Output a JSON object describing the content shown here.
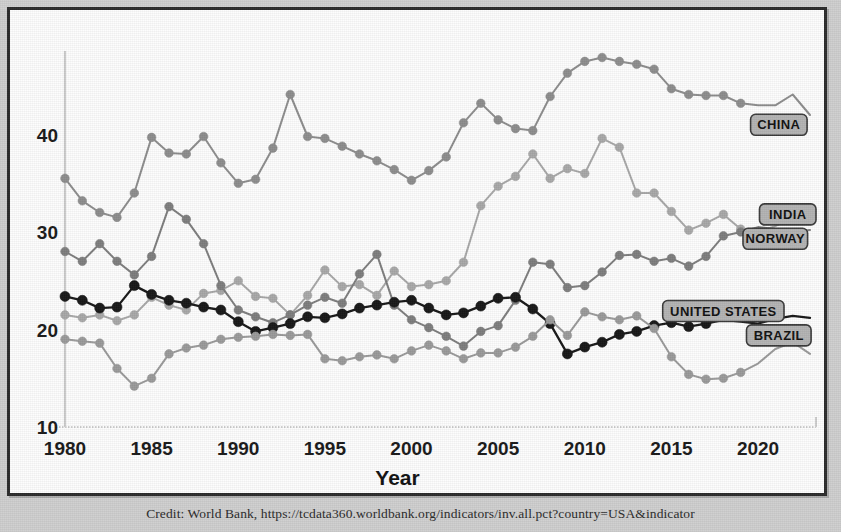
{
  "figure": {
    "credit": "Credit: World Bank, https://tcdata360.worldbank.org/indicators/inv.all.pct?country=USA&indicator"
  },
  "chart_data": {
    "type": "line",
    "title": "",
    "xlabel": "Year",
    "ylabel": "",
    "xlim": [
      1980,
      2023
    ],
    "ylim": [
      10,
      50
    ],
    "grid": false,
    "legend_position": "right-inline-labels",
    "xticks": [
      1980,
      1985,
      1990,
      1995,
      2000,
      2005,
      2010,
      2015,
      2020
    ],
    "yticks": [
      10,
      20,
      30,
      40
    ],
    "x": [
      1980,
      1981,
      1982,
      1983,
      1984,
      1985,
      1986,
      1987,
      1988,
      1989,
      1990,
      1991,
      1992,
      1993,
      1994,
      1995,
      1996,
      1997,
      1998,
      1999,
      2000,
      2001,
      2002,
      2003,
      2004,
      2005,
      2006,
      2007,
      2008,
      2009,
      2010,
      2011,
      2012,
      2013,
      2014,
      2015,
      2016,
      2017,
      2018,
      2019,
      2020,
      2021,
      2022,
      2023
    ],
    "series": [
      {
        "name": "CHINA",
        "color": "#8d8d8d",
        "marker": "circle",
        "values": [
          35.5,
          33.2,
          32.0,
          31.5,
          34.0,
          39.7,
          38.1,
          38.0,
          39.8,
          37.1,
          35.0,
          35.4,
          38.6,
          44.1,
          39.8,
          39.6,
          38.8,
          38.0,
          37.3,
          36.4,
          35.3,
          36.3,
          37.7,
          41.2,
          43.2,
          41.5,
          40.6,
          40.4,
          43.9,
          46.3,
          47.5,
          47.9,
          47.5,
          47.2,
          46.7,
          44.7,
          44.1,
          44.0,
          44.0,
          43.2,
          43.0,
          43.0,
          44.1,
          42.0
        ]
      },
      {
        "name": "INDIA",
        "color": "#a8a8a8",
        "marker": "circle",
        "values": [
          21.5,
          21.2,
          21.5,
          20.9,
          21.5,
          23.3,
          22.5,
          22.0,
          23.7,
          24.0,
          25.0,
          23.4,
          23.2,
          21.5,
          23.5,
          26.1,
          24.4,
          24.6,
          23.5,
          26.0,
          24.4,
          24.6,
          25.0,
          26.9,
          32.7,
          34.7,
          35.7,
          38.0,
          35.5,
          36.5,
          36.0,
          39.6,
          38.7,
          34.0,
          34.0,
          32.1,
          30.2,
          30.9,
          31.8,
          30.3,
          30.0,
          30.6,
          31.5,
          31.4
        ]
      },
      {
        "name": "NORWAY",
        "color": "#7e7e7e",
        "marker": "circle",
        "values": [
          28.0,
          27.0,
          28.8,
          27.0,
          25.6,
          27.5,
          32.6,
          31.3,
          28.8,
          24.5,
          22.0,
          21.3,
          20.7,
          21.5,
          22.5,
          23.3,
          22.7,
          25.7,
          27.7,
          22.5,
          21.0,
          20.2,
          19.3,
          18.3,
          19.8,
          20.4,
          23.0,
          26.9,
          26.7,
          24.3,
          24.5,
          25.9,
          27.6,
          27.7,
          27.0,
          27.3,
          26.5,
          27.5,
          29.6,
          30.0,
          30.5,
          30.3,
          30.0,
          30.2
        ]
      },
      {
        "name": "UNITED STATES",
        "color": "#181818",
        "marker": "circle-filled",
        "values": [
          23.4,
          23.0,
          22.2,
          22.3,
          24.5,
          23.6,
          23.0,
          22.7,
          22.3,
          22.0,
          20.8,
          19.8,
          20.2,
          20.6,
          21.3,
          21.2,
          21.6,
          22.2,
          22.5,
          22.8,
          23.0,
          22.2,
          21.5,
          21.7,
          22.4,
          23.2,
          23.3,
          22.1,
          20.6,
          17.5,
          18.2,
          18.7,
          19.5,
          19.8,
          20.4,
          20.7,
          20.3,
          20.6,
          21.0,
          20.8,
          20.6,
          21.1,
          21.4,
          21.2
        ]
      },
      {
        "name": "BRAZIL",
        "color": "#9a9a9a",
        "marker": "circle",
        "values": [
          19.0,
          18.8,
          18.6,
          16.0,
          14.2,
          15.0,
          17.5,
          18.1,
          18.4,
          19.0,
          19.2,
          19.3,
          19.5,
          19.4,
          19.5,
          17.0,
          16.8,
          17.2,
          17.4,
          17.0,
          17.8,
          18.4,
          17.8,
          17.0,
          17.6,
          17.6,
          18.2,
          19.3,
          21.0,
          19.4,
          21.8,
          21.3,
          21.0,
          21.4,
          20.1,
          17.2,
          15.4,
          14.9,
          15.0,
          15.6,
          16.5,
          18.0,
          18.7,
          17.5
        ]
      }
    ],
    "inline_labels": [
      {
        "text": "CHINA",
        "x": 2021.2,
        "y": 41.0
      },
      {
        "text": "INDIA",
        "x": 2022.0,
        "y": 31.8
      },
      {
        "text": "NORWAY",
        "x": 2021.0,
        "y": 29.3
      },
      {
        "text": "UNITED STATES",
        "x": 2018.0,
        "y": 21.9
      },
      {
        "text": "BRAZIL",
        "x": 2021.2,
        "y": 19.4
      }
    ]
  }
}
